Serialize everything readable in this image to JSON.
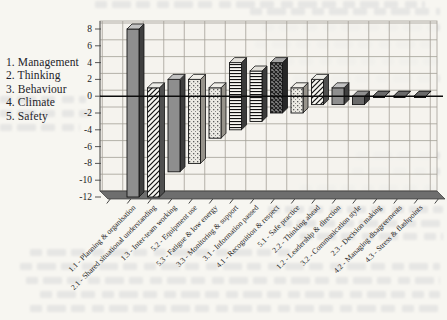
{
  "chart_data": {
    "type": "bar",
    "variant": "3d-floating-range-columns",
    "title": "",
    "xlabel": "",
    "ylabel": "",
    "ylim": [
      -12,
      8
    ],
    "ytick_interval": 2,
    "grid": true,
    "legend_position": "left",
    "legend": [
      "1. Management",
      "2. Thinking",
      "3. Behaviour",
      "4. Climate",
      "5. Safety"
    ],
    "bars": [
      {
        "label": "1.1 - Planning & organisation",
        "low": -12,
        "high": 8,
        "pattern": "solid"
      },
      {
        "label": "2.1 - Shared situational understanding",
        "low": -12,
        "high": 1,
        "pattern": "diagonal-hatch"
      },
      {
        "label": "1.3 - Inter-team working",
        "low": -9,
        "high": 2,
        "pattern": "solid"
      },
      {
        "label": "5.2 - Equipment use",
        "low": -8,
        "high": 2,
        "pattern": "dotted"
      },
      {
        "label": "5.3 - Fatigue & low energy",
        "low": -5,
        "high": 1,
        "pattern": "dotted"
      },
      {
        "label": "3.3 - Monitoring & support",
        "low": -4,
        "high": 4,
        "pattern": "horizontal-lines"
      },
      {
        "label": "3.1 - Information passed",
        "low": -3,
        "high": 3,
        "pattern": "horizontal-lines"
      },
      {
        "label": "4.1 - Recognition & respect",
        "low": -2,
        "high": 4,
        "pattern": "dark-check"
      },
      {
        "label": "5.1 - Safe practice",
        "low": -2,
        "high": 1,
        "pattern": "dotted"
      },
      {
        "label": "2.2 - Thinking ahead",
        "low": -1,
        "high": 2,
        "pattern": "diagonal-hatch"
      },
      {
        "label": "1.2 - Leadership & direction",
        "low": -1,
        "high": 1,
        "pattern": "solid"
      },
      {
        "label": "3.2 - Communication style",
        "low": -1,
        "high": 0,
        "pattern": "solid-dark"
      },
      {
        "label": "2.3 - Decision making",
        "low": 0,
        "high": 0,
        "pattern": "solid-dark"
      },
      {
        "label": "4.2 - Managing disagreements",
        "low": 0,
        "high": 0,
        "pattern": "solid-dark"
      },
      {
        "label": "4.3 - Stress & flashpoints",
        "low": 0,
        "high": 0,
        "pattern": "solid-dark"
      }
    ],
    "colors": {
      "bar_solid_gray": "#8e8e8e",
      "bar_dark_gray": "#6a6a6a",
      "pattern_ink": "#111111",
      "floor": "#6e6e6e",
      "wall": "#f4f2ed",
      "gridline": "#a39f97",
      "axis_text": "#222222"
    }
  }
}
